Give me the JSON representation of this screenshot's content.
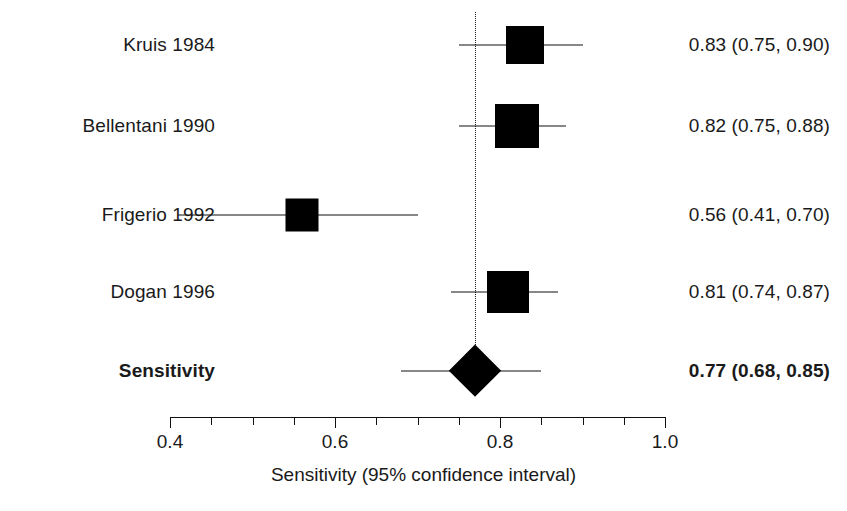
{
  "chart_data": {
    "type": "forest",
    "title": "",
    "xlabel": "Sensitivity (95% confidence interval)",
    "ylabel": "",
    "xlim": [
      0.4,
      1.0
    ],
    "xticks": [
      0.4,
      0.6,
      0.8,
      1.0
    ],
    "xticklabels": [
      "0.4",
      "0.6",
      "0.8",
      "1.0"
    ],
    "minor_tick_step": 0.05,
    "grid": false,
    "reference_line": 0.77,
    "legend": "none",
    "rows": [
      {
        "label": "Kruis 1984",
        "estimate": 0.83,
        "ci_low": 0.75,
        "ci_high": 0.9,
        "text": "0.83 (0.75, 0.90)",
        "box_size": 38,
        "is_summary": false
      },
      {
        "label": "Bellentani 1990",
        "estimate": 0.82,
        "ci_low": 0.75,
        "ci_high": 0.88,
        "text": "0.82 (0.75, 0.88)",
        "box_size": 44,
        "is_summary": false
      },
      {
        "label": "Frigerio 1992",
        "estimate": 0.56,
        "ci_low": 0.41,
        "ci_high": 0.7,
        "text": "0.56 (0.41, 0.70)",
        "box_size": 33,
        "is_summary": false
      },
      {
        "label": "Dogan 1996",
        "estimate": 0.81,
        "ci_low": 0.74,
        "ci_high": 0.87,
        "text": "0.81 (0.74, 0.87)",
        "box_size": 42,
        "is_summary": false
      },
      {
        "label": "Sensitivity",
        "estimate": 0.77,
        "ci_low": 0.68,
        "ci_high": 0.85,
        "text": "0.77 (0.68, 0.85)",
        "box_size": 52,
        "is_summary": true
      }
    ]
  },
  "colors": {
    "marker": "#000000",
    "axis": "#111111",
    "text": "#1a1a1a",
    "background": "#ffffff"
  }
}
